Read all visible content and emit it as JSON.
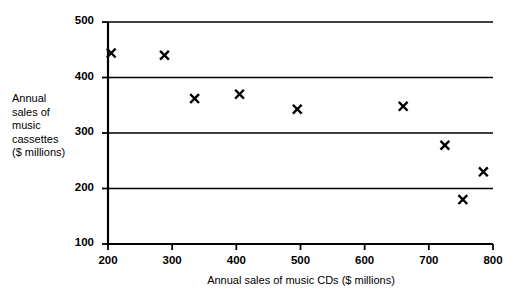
{
  "chart_data": {
    "type": "scatter",
    "title": "",
    "xlabel": "Annual sales of music CDs  ($ millions)",
    "ylabel": "Annual\nsales of\nmusic\ncassettes\n($ millions)",
    "xlim": [
      200,
      800
    ],
    "ylim": [
      100,
      500
    ],
    "xticks": [
      200,
      300,
      400,
      500,
      600,
      700,
      800
    ],
    "yticks": [
      100,
      200,
      300,
      400,
      500
    ],
    "xtick_labels": [
      "200",
      "300",
      "400",
      "500",
      "600",
      "700",
      "800"
    ],
    "ytick_labels": [
      "100",
      "200",
      "300",
      "400",
      "500"
    ],
    "grid": "horizontal",
    "gridlines_y": [
      200,
      300,
      400,
      500
    ],
    "legend": "none",
    "marker": "x",
    "marker_color": "#000000",
    "axis_color": "#000000",
    "points": [
      {
        "x": 205,
        "y": 444
      },
      {
        "x": 288,
        "y": 440
      },
      {
        "x": 335,
        "y": 362
      },
      {
        "x": 405,
        "y": 370
      },
      {
        "x": 495,
        "y": 343
      },
      {
        "x": 660,
        "y": 348
      },
      {
        "x": 725,
        "y": 278
      },
      {
        "x": 753,
        "y": 180
      },
      {
        "x": 785,
        "y": 230
      }
    ]
  }
}
